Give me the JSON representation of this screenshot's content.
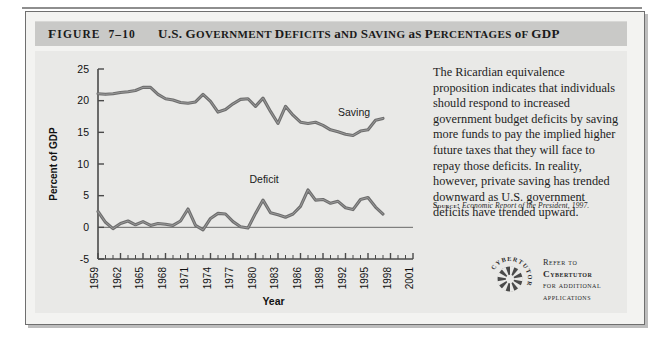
{
  "figure": {
    "label": "Figure",
    "number": "7-10",
    "title": "U.S. Government Deficits and Saving as Percentages of GDP"
  },
  "body": {
    "paragraph": "The Ricardian equivalence proposition indicates that individuals should respond to increased government budget deficits by saving more funds to pay the implied higher future taxes that they will face to repay those deficits. In reality, however, private saving has trended downward as U.S. government deficits have trended upward.",
    "source_label": "Source:",
    "source_italic": "Economic Report of the President,",
    "source_year": "1997."
  },
  "cybertutor": {
    "logo_text": "CYBERTUTOR",
    "line1": "Refer to",
    "line2": "Cybertutor",
    "line3": "for additional",
    "line4": "applications"
  },
  "chart_data": {
    "type": "line",
    "title": "U.S. Government Deficits and Saving as Percentages of GDP",
    "xlabel": "Year",
    "ylabel": "Percent of GDP",
    "ylim": [
      -5,
      25
    ],
    "yticks": [
      25,
      20,
      15,
      10,
      5,
      0,
      -5
    ],
    "xlim": [
      1959,
      2001
    ],
    "xticks": [
      1959,
      1962,
      1965,
      1968,
      1971,
      1974,
      1977,
      1980,
      1983,
      1986,
      1989,
      1992,
      1995,
      1998,
      2001
    ],
    "grid": false,
    "legend": "inline-labels",
    "x": [
      1959,
      1960,
      1961,
      1962,
      1963,
      1964,
      1965,
      1966,
      1967,
      1968,
      1969,
      1970,
      1971,
      1972,
      1973,
      1974,
      1975,
      1976,
      1977,
      1978,
      1979,
      1980,
      1981,
      1982,
      1983,
      1984,
      1985,
      1986,
      1987,
      1988,
      1989,
      1990,
      1991,
      1992,
      1993,
      1994,
      1995,
      1996,
      1997
    ],
    "series": [
      {
        "name": "Saving",
        "label": "Saving",
        "color": "#6e6e6e",
        "values": [
          21.1,
          21.0,
          21.1,
          21.3,
          21.4,
          21.6,
          22.1,
          22.1,
          21.0,
          20.3,
          20.1,
          19.7,
          19.6,
          19.8,
          21.0,
          19.9,
          18.2,
          18.6,
          19.5,
          20.2,
          20.3,
          19.1,
          20.4,
          18.3,
          16.4,
          19.1,
          17.7,
          16.6,
          16.4,
          16.6,
          16.1,
          15.4,
          15.1,
          14.7,
          14.5,
          15.2,
          15.4,
          16.9,
          17.2
        ]
      },
      {
        "name": "Deficit",
        "label": "Deficit",
        "color": "#6e6e6e",
        "values": [
          2.5,
          0.8,
          -0.2,
          0.6,
          1.0,
          0.4,
          0.9,
          0.3,
          0.6,
          0.5,
          0.3,
          1.0,
          2.9,
          0.3,
          -0.4,
          1.4,
          2.2,
          2.1,
          0.9,
          0.1,
          -0.1,
          2.2,
          4.3,
          2.3,
          2.0,
          1.6,
          2.1,
          3.3,
          5.9,
          4.3,
          4.4,
          3.8,
          4.1,
          3.1,
          2.8,
          4.4,
          4.7,
          3.2,
          2.1
        ]
      }
    ]
  }
}
